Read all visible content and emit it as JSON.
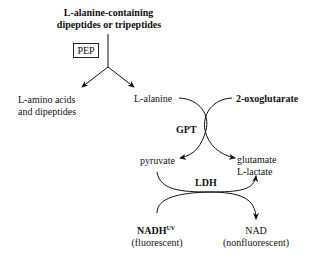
{
  "diagram": {
    "substrate": {
      "line1": "L-alanine-containing",
      "line2": "dipeptides or tripeptides"
    },
    "enzyme_pep": "PEP",
    "products_left": {
      "line1": "L-amino acids",
      "line2": "and dipeptides"
    },
    "l_alanine": "L-alanine",
    "oxoglutarate": "2-oxoglutarate",
    "enzyme_gpt": "GPT",
    "pyruvate": "pyruvate",
    "glutamate": "glutamate",
    "l_lactate": "L-lactate",
    "enzyme_ldh": "LDH",
    "nadh": {
      "name": "NADH",
      "superscript": "UV",
      "note": "(fluorescent)"
    },
    "nad": {
      "name": "NAD",
      "note": "(nonfluorescent)"
    }
  }
}
